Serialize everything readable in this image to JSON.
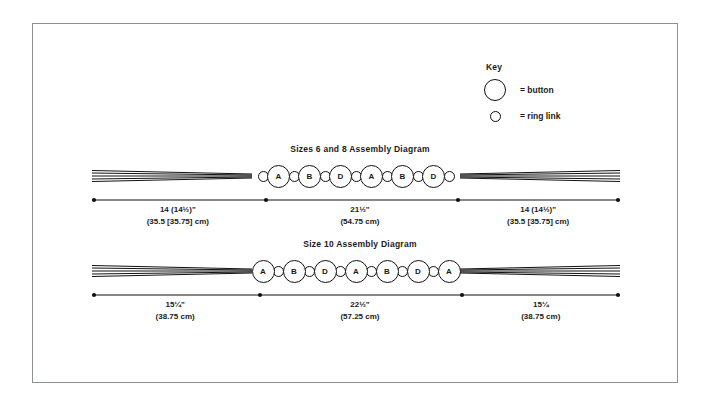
{
  "key": {
    "title": "Key",
    "rows": [
      {
        "icon": "large-circle-icon",
        "label": "= button"
      },
      {
        "icon": "small-circle-icon",
        "label": "= ring link"
      }
    ]
  },
  "diagrams": [
    {
      "title": "Sizes 6 and 8 Assembly Diagram",
      "starts_with_ring": true,
      "ends_with_ring": true,
      "buttons": [
        "A",
        "B",
        "D",
        "A",
        "B",
        "D"
      ],
      "measurements": [
        {
          "inches": "14 (14½)\"",
          "cm": "(35.5 [35.75] cm)",
          "width_pct": 32.5
        },
        {
          "inches": "21½\"",
          "cm": "(54.75 cm)",
          "width_pct": 36.5
        },
        {
          "inches": "14 (14½)\"",
          "cm": "(35.5 [35.75] cm)",
          "width_pct": 31.0
        }
      ]
    },
    {
      "title": "Size 10 Assembly Diagram",
      "starts_with_ring": false,
      "ends_with_ring": false,
      "buttons": [
        "A",
        "B",
        "D",
        "A",
        "B",
        "D",
        "A"
      ],
      "measurements": [
        {
          "inches": "15¼\"",
          "cm": "(38.75 cm)",
          "width_pct": 31.5
        },
        {
          "inches": "22½\"",
          "cm": "(57.25 cm)",
          "width_pct": 38.5
        },
        {
          "inches": "15¼",
          "cm": "(38.75 cm)",
          "width_pct": 30.0
        }
      ]
    }
  ],
  "colors": {
    "frame_border": "#8d9095",
    "ink": "#111111",
    "background": "#ffffff"
  }
}
